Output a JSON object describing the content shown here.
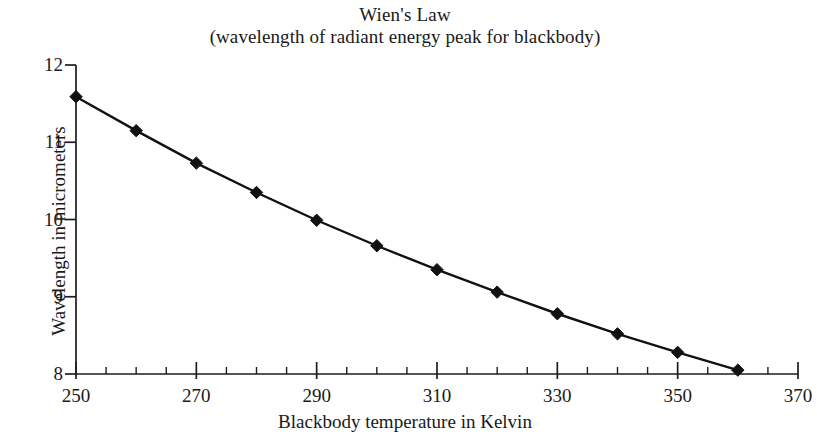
{
  "chart_data": {
    "type": "line",
    "title": "Wien's Law",
    "subtitle": "(wavelength of radiant energy peak for blackbody)",
    "xlabel": "Blackbody temperature in Kelvin",
    "ylabel": "Wavelength in micrometers",
    "xlim": [
      250,
      370
    ],
    "ylim": [
      8,
      12
    ],
    "grid": false,
    "legend": "none",
    "marker": "diamond",
    "marker_color": "#111111",
    "line_color": "#111111",
    "background_color": "#ffffff",
    "x_major_ticks": [
      250,
      270,
      290,
      310,
      330,
      350,
      370
    ],
    "x_minor_tick_step": 5,
    "y_major_ticks": [
      8,
      9,
      10,
      11,
      12
    ],
    "x_tick_labels": [
      "250",
      "270",
      "290",
      "310",
      "330",
      "350",
      "370"
    ],
    "y_tick_labels": [
      "8",
      "9",
      "10",
      "11",
      "12"
    ],
    "x": [
      250,
      260,
      270,
      280,
      290,
      300,
      310,
      320,
      330,
      340,
      350,
      360
    ],
    "values": [
      11.59,
      11.15,
      10.73,
      10.35,
      9.99,
      9.66,
      9.35,
      9.06,
      8.78,
      8.52,
      8.28,
      8.05
    ],
    "series": [
      {
        "name": "peak wavelength",
        "values": [
          11.59,
          11.15,
          10.73,
          10.35,
          9.99,
          9.66,
          9.35,
          9.06,
          8.78,
          8.52,
          8.28,
          8.05
        ]
      }
    ]
  }
}
